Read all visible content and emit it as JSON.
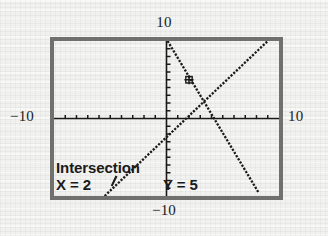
{
  "device": {
    "name": "graphing-calculator-screen",
    "bezel_color": "#70706e",
    "ink_color": "#1a1a1a",
    "paper_color": "#f1f1ef"
  },
  "axis_labels": {
    "top": "10",
    "bottom": "−10",
    "left": "−10",
    "right": "10"
  },
  "readout": {
    "title": "Intersection",
    "x_label": "X = 2",
    "y_label": "Y = 5",
    "cursor_icon": "blinking-cursor-icon"
  },
  "chart_data": {
    "type": "line",
    "title": "Intersection",
    "xlabel": "",
    "ylabel": "",
    "xlim": [
      -10,
      10
    ],
    "ylim": [
      -10,
      10
    ],
    "grid": false,
    "legend": "none",
    "axis_ticks": {
      "x": [
        -9,
        -8,
        -7,
        -6,
        -5,
        -4,
        -3,
        -2,
        -1,
        1,
        2,
        3,
        4,
        5,
        6,
        7,
        8,
        9
      ],
      "y": [
        -9,
        -8,
        -7,
        -6,
        -5,
        -4,
        -3,
        -2,
        -1,
        1,
        2,
        3,
        4,
        5,
        6,
        7,
        8,
        9
      ],
      "tick_step": 1
    },
    "series": [
      {
        "name": "Y1 = 2X + 1",
        "style": "dotted",
        "x": [
          -5.5,
          9.0
        ],
        "y": [
          -10.0,
          10.0
        ],
        "slope": 1.38,
        "intercept": 2.4
      },
      {
        "name": "Y2 = -2X + 9",
        "style": "dotted",
        "x": [
          0.1,
          8.2
        ],
        "y": [
          10.0,
          -9.6
        ],
        "slope": -2.42,
        "intercept": 10.24
      }
    ],
    "annotations": [
      {
        "label": "Intersection",
        "x": 2,
        "y": 5,
        "marker": "cursor-crosshair"
      }
    ]
  }
}
